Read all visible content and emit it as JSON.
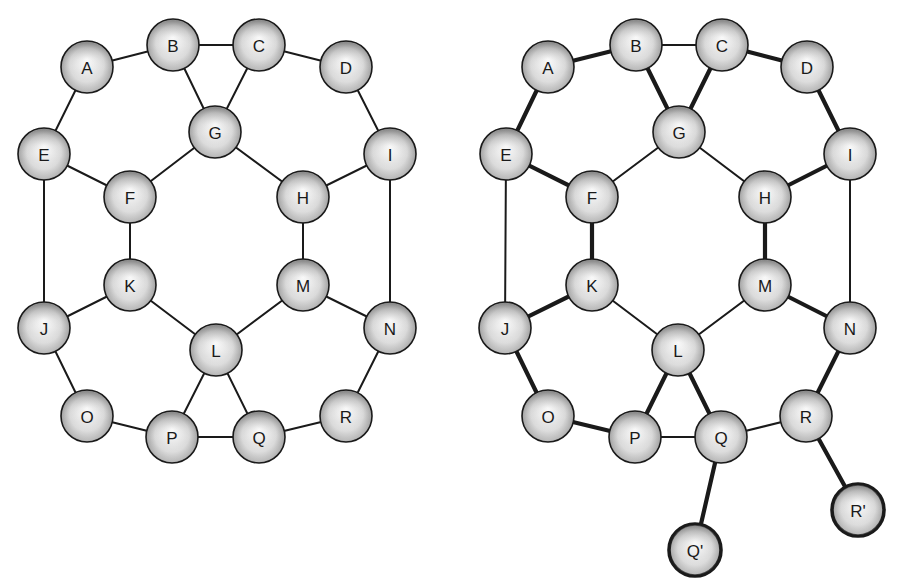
{
  "figure": {
    "background": "#ffffff",
    "node_radius": 26,
    "colors": {
      "stroke": "#1a1a1a",
      "node_light": "#ffffff",
      "node_dark": "#8a8a8a"
    }
  },
  "graphs": [
    {
      "id": "left",
      "nodes": [
        {
          "id": "A",
          "label": "A",
          "x": 87,
          "y": 67
        },
        {
          "id": "B",
          "label": "B",
          "x": 173,
          "y": 45
        },
        {
          "id": "C",
          "label": "C",
          "x": 259,
          "y": 45
        },
        {
          "id": "D",
          "label": "D",
          "x": 346,
          "y": 67
        },
        {
          "id": "E",
          "label": "E",
          "x": 44,
          "y": 154
        },
        {
          "id": "G",
          "label": "G",
          "x": 215,
          "y": 132
        },
        {
          "id": "I",
          "label": "I",
          "x": 390,
          "y": 154
        },
        {
          "id": "F",
          "label": "F",
          "x": 130,
          "y": 197
        },
        {
          "id": "H",
          "label": "H",
          "x": 303,
          "y": 197
        },
        {
          "id": "K",
          "label": "K",
          "x": 130,
          "y": 285
        },
        {
          "id": "M",
          "label": "M",
          "x": 303,
          "y": 285
        },
        {
          "id": "J",
          "label": "J",
          "x": 44,
          "y": 328
        },
        {
          "id": "L",
          "label": "L",
          "x": 216,
          "y": 350
        },
        {
          "id": "N",
          "label": "N",
          "x": 390,
          "y": 328
        },
        {
          "id": "O",
          "label": "O",
          "x": 87,
          "y": 416
        },
        {
          "id": "P",
          "label": "P",
          "x": 172,
          "y": 437
        },
        {
          "id": "Q",
          "label": "Q",
          "x": 259,
          "y": 437
        },
        {
          "id": "R",
          "label": "R",
          "x": 346,
          "y": 416
        }
      ],
      "edges": [
        {
          "from": "A",
          "to": "B",
          "bold": false
        },
        {
          "from": "B",
          "to": "C",
          "bold": false
        },
        {
          "from": "C",
          "to": "D",
          "bold": false
        },
        {
          "from": "A",
          "to": "E",
          "bold": false
        },
        {
          "from": "D",
          "to": "I",
          "bold": false
        },
        {
          "from": "B",
          "to": "G",
          "bold": false
        },
        {
          "from": "C",
          "to": "G",
          "bold": false
        },
        {
          "from": "E",
          "to": "F",
          "bold": false
        },
        {
          "from": "F",
          "to": "G",
          "bold": false
        },
        {
          "from": "G",
          "to": "H",
          "bold": false
        },
        {
          "from": "H",
          "to": "I",
          "bold": false
        },
        {
          "from": "E",
          "to": "J",
          "bold": false
        },
        {
          "from": "I",
          "to": "N",
          "bold": false
        },
        {
          "from": "F",
          "to": "K",
          "bold": false
        },
        {
          "from": "H",
          "to": "M",
          "bold": false
        },
        {
          "from": "J",
          "to": "K",
          "bold": false
        },
        {
          "from": "K",
          "to": "L",
          "bold": false
        },
        {
          "from": "L",
          "to": "M",
          "bold": false
        },
        {
          "from": "M",
          "to": "N",
          "bold": false
        },
        {
          "from": "J",
          "to": "O",
          "bold": false
        },
        {
          "from": "N",
          "to": "R",
          "bold": false
        },
        {
          "from": "O",
          "to": "P",
          "bold": false
        },
        {
          "from": "P",
          "to": "Q",
          "bold": false
        },
        {
          "from": "Q",
          "to": "R",
          "bold": false
        },
        {
          "from": "L",
          "to": "P",
          "bold": false
        },
        {
          "from": "L",
          "to": "Q",
          "bold": false
        }
      ]
    },
    {
      "id": "right",
      "nodes": [
        {
          "id": "A",
          "label": "A",
          "x": 548,
          "y": 67
        },
        {
          "id": "B",
          "label": "B",
          "x": 636,
          "y": 45
        },
        {
          "id": "C",
          "label": "C",
          "x": 722,
          "y": 45
        },
        {
          "id": "D",
          "label": "D",
          "x": 807,
          "y": 67
        },
        {
          "id": "E",
          "label": "E",
          "x": 506,
          "y": 154
        },
        {
          "id": "G",
          "label": "G",
          "x": 679,
          "y": 132
        },
        {
          "id": "I",
          "label": "I",
          "x": 850,
          "y": 154
        },
        {
          "id": "F",
          "label": "F",
          "x": 592,
          "y": 197
        },
        {
          "id": "H",
          "label": "H",
          "x": 765,
          "y": 197
        },
        {
          "id": "K",
          "label": "K",
          "x": 592,
          "y": 285
        },
        {
          "id": "M",
          "label": "M",
          "x": 765,
          "y": 285
        },
        {
          "id": "J",
          "label": "J",
          "x": 505,
          "y": 328
        },
        {
          "id": "L",
          "label": "L",
          "x": 678,
          "y": 350
        },
        {
          "id": "N",
          "label": "N",
          "x": 850,
          "y": 328
        },
        {
          "id": "O",
          "label": "O",
          "x": 548,
          "y": 416
        },
        {
          "id": "P",
          "label": "P",
          "x": 635,
          "y": 437
        },
        {
          "id": "Q",
          "label": "Q",
          "x": 721,
          "y": 437
        },
        {
          "id": "R",
          "label": "R",
          "x": 806,
          "y": 416
        },
        {
          "id": "Q2",
          "label": "Q'",
          "x": 695,
          "y": 550,
          "bold": true
        },
        {
          "id": "R2",
          "label": "R'",
          "x": 858,
          "y": 510,
          "bold": true
        }
      ],
      "edges": [
        {
          "from": "A",
          "to": "B",
          "bold": true
        },
        {
          "from": "B",
          "to": "C",
          "bold": false
        },
        {
          "from": "C",
          "to": "D",
          "bold": true
        },
        {
          "from": "A",
          "to": "E",
          "bold": true
        },
        {
          "from": "D",
          "to": "I",
          "bold": true
        },
        {
          "from": "B",
          "to": "G",
          "bold": true
        },
        {
          "from": "C",
          "to": "G",
          "bold": true
        },
        {
          "from": "E",
          "to": "F",
          "bold": true
        },
        {
          "from": "F",
          "to": "G",
          "bold": false
        },
        {
          "from": "G",
          "to": "H",
          "bold": false
        },
        {
          "from": "H",
          "to": "I",
          "bold": true
        },
        {
          "from": "E",
          "to": "J",
          "bold": false
        },
        {
          "from": "I",
          "to": "N",
          "bold": false
        },
        {
          "from": "F",
          "to": "K",
          "bold": true
        },
        {
          "from": "H",
          "to": "M",
          "bold": true
        },
        {
          "from": "J",
          "to": "K",
          "bold": true
        },
        {
          "from": "K",
          "to": "L",
          "bold": false
        },
        {
          "from": "L",
          "to": "M",
          "bold": false
        },
        {
          "from": "M",
          "to": "N",
          "bold": true
        },
        {
          "from": "J",
          "to": "O",
          "bold": true
        },
        {
          "from": "N",
          "to": "R",
          "bold": true
        },
        {
          "from": "O",
          "to": "P",
          "bold": true
        },
        {
          "from": "P",
          "to": "Q",
          "bold": false
        },
        {
          "from": "Q",
          "to": "R",
          "bold": false
        },
        {
          "from": "L",
          "to": "P",
          "bold": true
        },
        {
          "from": "L",
          "to": "Q",
          "bold": true
        },
        {
          "from": "Q",
          "to": "Q2",
          "bold": true
        },
        {
          "from": "R",
          "to": "R2",
          "bold": true
        }
      ]
    }
  ]
}
